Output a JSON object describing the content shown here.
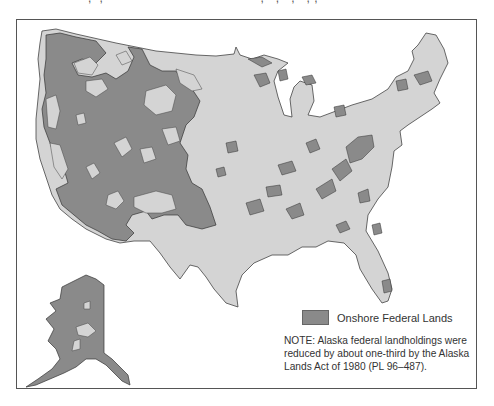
{
  "figure": {
    "title_cropped": "",
    "colors": {
      "background": "#ffffff",
      "non_federal_land": "#d4d4d4",
      "federal_land": "#8a8a8a",
      "outline": "#444444",
      "frame": "#555555"
    }
  },
  "legend": {
    "items": [
      {
        "label": "Onshore Federal Lands",
        "color": "#8a8a8a"
      }
    ]
  },
  "note": {
    "text": "NOTE: Alaska federal landholdings were reduced by about one-third by the Alaska Lands Act of 1980 (PL 96–487)."
  },
  "map": {
    "regions": [
      "Contiguous United States",
      "Alaska (inset)"
    ],
    "federal_land_concentration": "Western states",
    "eastern_patches": "Scattered national forests along Appalachians, Great Lakes, Gulf states"
  }
}
